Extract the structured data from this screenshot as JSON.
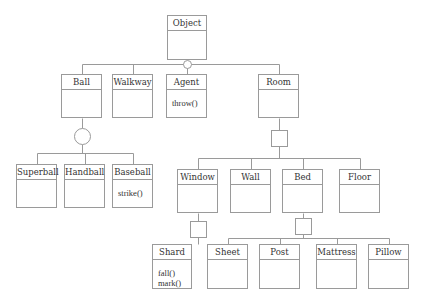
{
  "diagram": {
    "type": "UML class diagram",
    "line_color": "#9a9a9a",
    "classes": [
      {
        "id": "object",
        "name": "Object",
        "ops": [],
        "x": 167,
        "y": 15,
        "w": 40,
        "h": 45
      },
      {
        "id": "ball",
        "name": "Ball",
        "ops": [],
        "x": 61,
        "y": 74,
        "w": 41,
        "h": 44
      },
      {
        "id": "walkway",
        "name": "Walkway",
        "ops": [],
        "x": 112,
        "y": 74,
        "w": 41,
        "h": 44
      },
      {
        "id": "agent",
        "name": "Agent",
        "ops": [
          "throw()"
        ],
        "x": 166,
        "y": 74,
        "w": 41,
        "h": 44
      },
      {
        "id": "room",
        "name": "Room",
        "ops": [],
        "x": 258,
        "y": 74,
        "w": 41,
        "h": 44
      },
      {
        "id": "superball",
        "name": "Superball",
        "ops": [],
        "x": 16,
        "y": 164,
        "w": 41,
        "h": 44
      },
      {
        "id": "handball",
        "name": "Handball",
        "ops": [],
        "x": 64,
        "y": 164,
        "w": 41,
        "h": 44
      },
      {
        "id": "baseball",
        "name": "Baseball",
        "ops": [
          "strike()"
        ],
        "x": 112,
        "y": 164,
        "w": 41,
        "h": 44
      },
      {
        "id": "window",
        "name": "Window",
        "ops": [],
        "x": 177,
        "y": 169,
        "w": 41,
        "h": 44
      },
      {
        "id": "wall",
        "name": "Wall",
        "ops": [],
        "x": 230,
        "y": 169,
        "w": 41,
        "h": 44
      },
      {
        "id": "bed",
        "name": "Bed",
        "ops": [],
        "x": 282,
        "y": 169,
        "w": 41,
        "h": 44
      },
      {
        "id": "floor",
        "name": "Floor",
        "ops": [],
        "x": 339,
        "y": 169,
        "w": 41,
        "h": 44
      },
      {
        "id": "shard",
        "name": "Shard",
        "ops": [
          "fall()",
          "mark()"
        ],
        "x": 152,
        "y": 244,
        "w": 40,
        "h": 45
      },
      {
        "id": "sheet",
        "name": "Sheet",
        "ops": [],
        "x": 207,
        "y": 244,
        "w": 41,
        "h": 45
      },
      {
        "id": "post",
        "name": "Post",
        "ops": [],
        "x": 259,
        "y": 244,
        "w": 41,
        "h": 45
      },
      {
        "id": "mattress",
        "name": "Mattress",
        "ops": [],
        "x": 316,
        "y": 244,
        "w": 41,
        "h": 45
      },
      {
        "id": "pillow",
        "name": "Pillow",
        "ops": [],
        "x": 368,
        "y": 244,
        "w": 41,
        "h": 45
      }
    ],
    "relations": [
      {
        "parent": "object",
        "marker": "circle-small",
        "children": [
          "ball",
          "walkway",
          "agent",
          "room"
        ],
        "bus_y": 64
      },
      {
        "parent": "ball",
        "marker": "circle-large",
        "children": [
          "superball",
          "handball",
          "baseball"
        ],
        "bus_y": 153
      },
      {
        "parent": "room",
        "marker": "square",
        "children": [
          "window",
          "wall",
          "bed",
          "floor"
        ],
        "bus_y": 158
      },
      {
        "parent": "window",
        "marker": "square",
        "children": [
          "shard"
        ],
        "bus_y": null
      },
      {
        "parent": "bed",
        "marker": "square",
        "children": [
          "sheet",
          "post",
          "mattress",
          "pillow"
        ],
        "bus_y": 238
      }
    ]
  }
}
